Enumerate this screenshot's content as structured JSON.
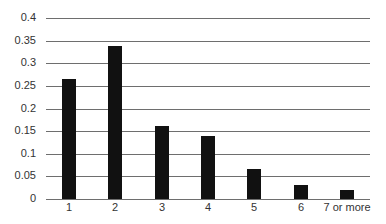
{
  "chart_data": {
    "type": "bar",
    "title": "",
    "xlabel": "",
    "ylabel": "",
    "categories": [
      "1",
      "2",
      "3",
      "4",
      "5",
      "6",
      "7 or more"
    ],
    "values": [
      0.266,
      0.338,
      0.161,
      0.139,
      0.066,
      0.031,
      0.02
    ],
    "ylim": [
      0,
      0.4
    ],
    "yticks": [
      "0",
      "0.05",
      "0.1",
      "0.15",
      "0.2",
      "0.25",
      "0.3",
      "0.35",
      "0.4"
    ],
    "grid": true,
    "legend": null,
    "bar_color": "#111111",
    "grid_color": "#6e6e6e"
  }
}
